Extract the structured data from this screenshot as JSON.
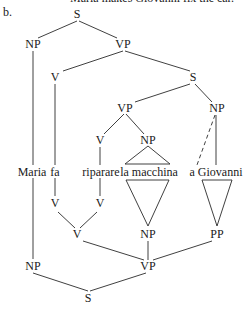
{
  "caption": "Maria makes Giovanni fix the car.",
  "item_label": "b.",
  "top_tree": {
    "nodes": [
      {
        "id": "s0",
        "label": "S",
        "x": 77,
        "y": 14
      },
      {
        "id": "np1",
        "label": "NP",
        "x": 33,
        "y": 44
      },
      {
        "id": "vp1",
        "label": "VP",
        "x": 123,
        "y": 44
      },
      {
        "id": "v1",
        "label": "V",
        "x": 55,
        "y": 77
      },
      {
        "id": "s1",
        "label": "S",
        "x": 193,
        "y": 77
      },
      {
        "id": "vp2",
        "label": "VP",
        "x": 125,
        "y": 108
      },
      {
        "id": "np2",
        "label": "NP",
        "x": 217,
        "y": 108
      },
      {
        "id": "v2",
        "label": "V",
        "x": 100,
        "y": 140
      },
      {
        "id": "np3",
        "label": "NP",
        "x": 148,
        "y": 140
      }
    ]
  },
  "words": [
    {
      "text": "Maria",
      "x": 32,
      "y": 172
    },
    {
      "text": "fa",
      "x": 55,
      "y": 172
    },
    {
      "text": "riparare",
      "x": 101,
      "y": 172
    },
    {
      "text": "la macchina",
      "x": 149,
      "y": 172
    },
    {
      "text": "a Giovanni",
      "x": 216,
      "y": 172
    }
  ],
  "bottom_tree": {
    "nodes": [
      {
        "id": "bv1",
        "label": "V",
        "x": 55,
        "y": 203
      },
      {
        "id": "bv2",
        "label": "V",
        "x": 100,
        "y": 203
      },
      {
        "id": "bv3",
        "label": "V",
        "x": 77,
        "y": 234
      },
      {
        "id": "bnp1",
        "label": "NP",
        "x": 148,
        "y": 234
      },
      {
        "id": "bpp",
        "label": "PP",
        "x": 217,
        "y": 234
      },
      {
        "id": "bnp2",
        "label": "NP",
        "x": 33,
        "y": 266
      },
      {
        "id": "bvp",
        "label": "VP",
        "x": 148,
        "y": 266
      },
      {
        "id": "bs",
        "label": "S",
        "x": 88,
        "y": 298
      }
    ]
  }
}
